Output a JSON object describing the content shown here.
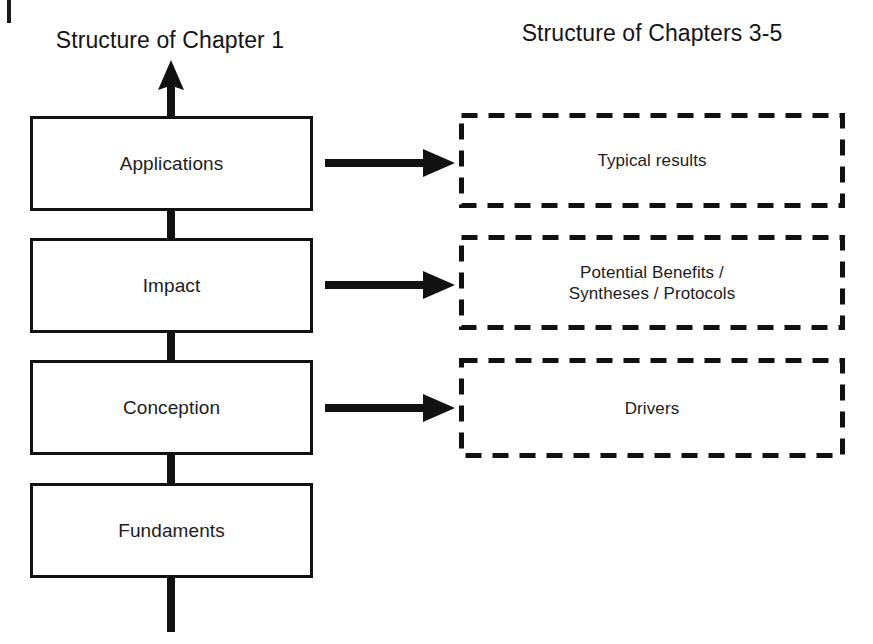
{
  "diagram": {
    "columns": {
      "left": {
        "title": "Structure of Chapter 1",
        "boxes": [
          {
            "label": "Applications"
          },
          {
            "label": "Impact"
          },
          {
            "label": "Conception"
          },
          {
            "label": "Fundaments"
          }
        ]
      },
      "right": {
        "title": "Structure of Chapters 3-5",
        "boxes": [
          {
            "label": "Typical results"
          },
          {
            "label": "Potential Benefits /\nSyntheses / Protocols"
          },
          {
            "label": "Drivers"
          }
        ]
      }
    },
    "connectors": {
      "up_arrow_icon": "arrow-up-icon",
      "mapping_arrow_icon": "arrow-right-icon",
      "stem_icon": "vertical-connector"
    },
    "colors": {
      "stroke": "#111111",
      "text": "#1c1c1c",
      "background": "#ffffff"
    }
  }
}
